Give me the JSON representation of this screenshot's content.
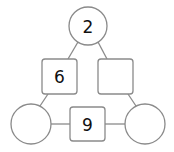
{
  "diagram": {
    "type": "number-triangle",
    "nodes": {
      "top_circle": {
        "value": "2"
      },
      "left_circle": {
        "value": ""
      },
      "right_circle": {
        "value": ""
      },
      "left_square": {
        "value": "6"
      },
      "right_square": {
        "value": ""
      },
      "bottom_square": {
        "value": "9"
      }
    },
    "colors": {
      "stroke": "#8a8a8a",
      "fill": "#ffffff",
      "text": "#111111"
    }
  }
}
